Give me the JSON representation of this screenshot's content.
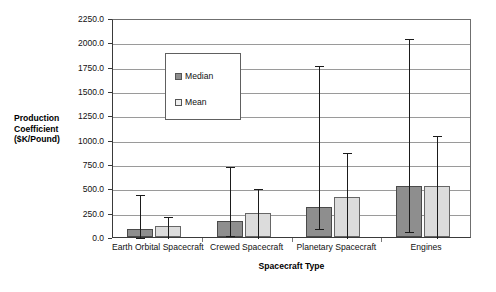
{
  "chart_data": {
    "type": "bar",
    "title": "",
    "xlabel": "Spacecraft Type",
    "ylabel": "Production Coefficient ($K/Pound)",
    "ylim": [
      0,
      2250
    ],
    "ytick_step": 250,
    "ytick_labels": [
      "2250.0",
      "2000.0",
      "1750.0",
      "1500.0",
      "1250.0",
      "1000.0",
      "750.0",
      "500.0",
      "250.0",
      "0.0"
    ],
    "grid": true,
    "legend_position": "upper-left-inside",
    "categories": [
      "Earth Orbital Spacecraft",
      "Crewed Spacecraft",
      "Planetary Spacecraft",
      "Engines"
    ],
    "series": [
      {
        "name": "Median",
        "color": "#8e8e8e",
        "values": [
          85,
          160,
          310,
          520
        ],
        "error_low": [
          10,
          30,
          100,
          75
        ],
        "error_high": [
          455,
          740,
          1780,
          2050
        ]
      },
      {
        "name": "Mean",
        "color": "#dcdcdc",
        "values": [
          115,
          245,
          410,
          525
        ],
        "error_low": [
          0,
          0,
          0,
          0
        ],
        "error_high": [
          230,
          510,
          880,
          1055
        ]
      }
    ]
  },
  "axes": {
    "y_title_lines": [
      "Production",
      "Coefficient",
      "($K/Pound)"
    ],
    "x_title": "Spacecraft Type"
  },
  "legend": {
    "items": [
      {
        "label": "Median",
        "swatch": "median-swatch"
      },
      {
        "label": "Mean",
        "swatch": "mean-swatch"
      }
    ]
  }
}
